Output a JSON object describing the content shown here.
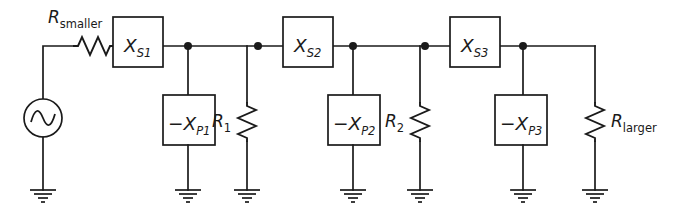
{
  "diagram": {
    "type": "electrical-schematic",
    "canvas": {
      "width": 682,
      "height": 216
    },
    "stroke_color": "#1a1a1a",
    "background_color": "#ffffff"
  },
  "source": {
    "name": "ac-voltage-source",
    "symbol": "sine-wave-circle",
    "center": {
      "x": 43,
      "y": 118
    },
    "radius": 19
  },
  "series_resistor": {
    "label_main": "R",
    "label_sub": "smaller",
    "orientation": "horizontal",
    "x_start": 73,
    "x_end": 113,
    "y": 46
  },
  "series_boxes": [
    {
      "label_main": "X",
      "label_sub": "S1",
      "x": 113,
      "y": 17,
      "w": 50,
      "h": 50
    },
    {
      "label_main": "X",
      "label_sub": "S2",
      "x": 283,
      "y": 17,
      "w": 50,
      "h": 50
    },
    {
      "label_main": "X",
      "label_sub": "S3",
      "x": 450,
      "y": 17,
      "w": 50,
      "h": 50
    }
  ],
  "shunt_boxes": [
    {
      "label_main": "−X",
      "label_sub": "P1",
      "x": 163,
      "y": 95,
      "w": 52,
      "h": 50
    },
    {
      "label_main": "−X",
      "label_sub": "P2",
      "x": 328,
      "y": 95,
      "w": 52,
      "h": 50
    },
    {
      "label_main": "−X",
      "label_sub": "P3",
      "x": 495,
      "y": 95,
      "w": 52,
      "h": 50
    }
  ],
  "shunt_resistors": [
    {
      "label_main": "R",
      "label_sub": "1",
      "sub_style": "upright",
      "x": 247,
      "y_top": 102,
      "y_bot": 142,
      "label_x": 218,
      "label_y": 128
    },
    {
      "label_main": "R",
      "label_sub": "2",
      "sub_style": "upright",
      "x": 420,
      "y_top": 102,
      "y_bot": 142,
      "label_x": 391,
      "label_y": 128
    },
    {
      "label_main": "R",
      "label_sub": "larger",
      "sub_style": "upright",
      "x": 595,
      "y_top": 102,
      "y_bot": 142,
      "label_x": 610,
      "label_y": 128
    }
  ],
  "nodes": [
    {
      "name": "node-1",
      "x": 188,
      "y": 46
    },
    {
      "name": "node-2",
      "x": 258,
      "y": 46
    },
    {
      "name": "node-3",
      "x": 353,
      "y": 46
    },
    {
      "name": "node-4",
      "x": 425,
      "y": 46
    },
    {
      "name": "node-5",
      "x": 523,
      "y": 46
    }
  ],
  "grounds": [
    {
      "name": "ground-source",
      "x": 43,
      "y": 190
    },
    {
      "name": "ground-xp1",
      "x": 188,
      "y": 190
    },
    {
      "name": "ground-r1",
      "x": 247,
      "y": 190
    },
    {
      "name": "ground-xp2",
      "x": 353,
      "y": 190
    },
    {
      "name": "ground-r2",
      "x": 420,
      "y": 190
    },
    {
      "name": "ground-xp3",
      "x": 523,
      "y": 190
    },
    {
      "name": "ground-rlarger",
      "x": 595,
      "y": 190
    }
  ],
  "rail": {
    "y": 46,
    "x_start": 43,
    "x_end": 595
  }
}
